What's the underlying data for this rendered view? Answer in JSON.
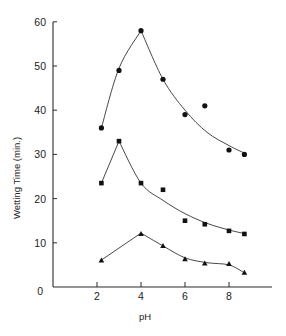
{
  "chart_data": {
    "type": "line",
    "title": "",
    "xlabel": "pH",
    "ylabel": "Wetting Time (min.)",
    "xlim": [
      0,
      9.9
    ],
    "ylim": [
      0,
      60
    ],
    "x_ticks": [
      0,
      2,
      4,
      6,
      8
    ],
    "y_ticks": [
      0,
      10,
      20,
      30,
      40,
      50,
      60
    ],
    "grid": false,
    "legend": null,
    "series": [
      {
        "name": "Series A (circles)",
        "marker": "circle",
        "x": [
          2.2,
          3.0,
          4.0,
          5.0,
          6.0,
          6.9,
          8.0,
          8.7
        ],
        "values": [
          36,
          49,
          58,
          47,
          39,
          41,
          31,
          30
        ],
        "fit_peak_index": 2
      },
      {
        "name": "Series B (squares)",
        "marker": "square",
        "x": [
          2.2,
          3.0,
          4.0,
          5.0,
          6.0,
          6.9,
          8.0,
          8.7
        ],
        "values": [
          23.5,
          33,
          23.5,
          22,
          15,
          14.2,
          12.7,
          12
        ],
        "fit_peak_index": 1
      },
      {
        "name": "Series C (triangles)",
        "marker": "triangle",
        "x": [
          2.2,
          4.0,
          5.0,
          6.0,
          6.9,
          8.0,
          8.7
        ],
        "values": [
          6,
          12,
          9.3,
          6.3,
          5.3,
          5.2,
          3.2
        ],
        "fit_peak_index": 1
      }
    ]
  },
  "axes": {
    "x_title": "pH",
    "y_title": "Wetting Time (min.)"
  }
}
